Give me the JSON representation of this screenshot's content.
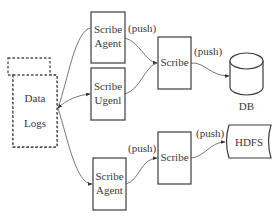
{
  "diagram": {
    "title": "",
    "nodes": {
      "data_logs": {
        "line1": "Data",
        "line2": "Logs",
        "style": "dashed stacked document"
      },
      "scribe_agent_top": {
        "line1": "Scribe",
        "line2": "Agent"
      },
      "scribe_ugenl": {
        "line1": "Scribe",
        "line2": "Ugenl"
      },
      "scribe_middle": {
        "label": "Scribe"
      },
      "db": {
        "label": "DB",
        "shape": "cylinder"
      },
      "scribe_agent_bottom": {
        "line1": "Scribe",
        "line2": "Agent"
      },
      "scribe_lower": {
        "label": "Scribe"
      },
      "hdfs": {
        "label": "HDFS",
        "shape": "storage"
      }
    },
    "edges": [
      {
        "from": "data_logs",
        "to": "scribe_agent_top",
        "label": ""
      },
      {
        "from": "data_logs",
        "to": "scribe_ugenl",
        "label": ""
      },
      {
        "from": "data_logs",
        "to": "scribe_agent_bottom",
        "label": ""
      },
      {
        "from": "scribe_agent_top",
        "to": "scribe_middle",
        "label": "(push)"
      },
      {
        "from": "scribe_ugenl",
        "to": "scribe_middle",
        "label": ""
      },
      {
        "from": "scribe_middle",
        "to": "db",
        "label": "(push)"
      },
      {
        "from": "scribe_agent_bottom",
        "to": "scribe_lower",
        "label": "(push)"
      },
      {
        "from": "scribe_lower",
        "to": "hdfs",
        "label": "(push)"
      }
    ],
    "edge_labels": {
      "agent_top_push": "(push)",
      "middle_push": "(push)",
      "agent_bottom_push": "(push)",
      "lower_push": "(push)"
    },
    "colors": {
      "stroke": "#3c3c3c",
      "text": "#3a3a3a",
      "background": "#ffffff"
    }
  }
}
